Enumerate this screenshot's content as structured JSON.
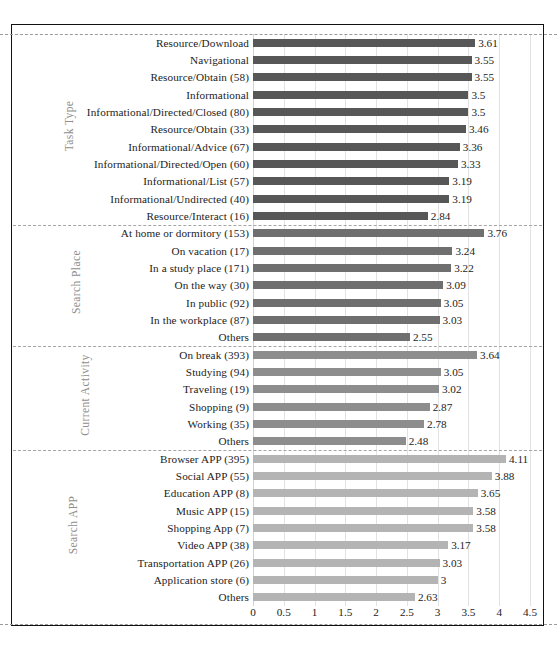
{
  "chart_data": {
    "type": "bar",
    "orientation": "horizontal",
    "title": "",
    "xlabel": "",
    "ylabel": "",
    "xlim": [
      0,
      4.5
    ],
    "xticks": [
      "0",
      "0.5",
      "1",
      "1.5",
      "2",
      "2.5",
      "3",
      "3.5",
      "4",
      "4.5"
    ],
    "xtick_values": [
      0,
      0.5,
      1,
      1.5,
      2,
      2.5,
      3,
      3.5,
      4,
      4.5
    ],
    "grid": true,
    "legend": "none",
    "groups": [
      {
        "name": "Task Type",
        "color": "#575757",
        "categories": [
          "Resource/Download",
          "Navigational",
          "Resource/Obtain (58)",
          "Informational",
          "Informational/Directed/Closed (80)",
          "Resource/Obtain (33)",
          "Informational/Advice (67)",
          "Informational/Directed/Open (60)",
          "Informational/List (57)",
          "Informational/Undirected (40)",
          "Resource/Interact (16)"
        ],
        "values": [
          3.61,
          3.55,
          3.55,
          3.5,
          3.5,
          3.46,
          3.36,
          3.33,
          3.19,
          3.19,
          2.84
        ],
        "value_labels": [
          "3.61",
          "3.55",
          "3.55",
          "3.5",
          "3.5",
          "3.46",
          "3.36",
          "3.33",
          "3.19",
          "3.19",
          "2.84"
        ]
      },
      {
        "name": "Search Place",
        "color": "#6f6f6f",
        "categories": [
          "At home or dormitory (153)",
          "On vacation (17)",
          "In a study place (171)",
          "On the way (30)",
          "In public (92)",
          "In the workplace (87)",
          "Others"
        ],
        "values": [
          3.76,
          3.24,
          3.22,
          3.09,
          3.05,
          3.03,
          2.55
        ],
        "value_labels": [
          "3.76",
          "3.24",
          "3.22",
          "3.09",
          "3.05",
          "3.03",
          "2.55"
        ]
      },
      {
        "name": "Current Activity",
        "color": "#8d8d8d",
        "categories": [
          "On break (393)",
          "Studying (94)",
          "Traveling (19)",
          "Shopping (9)",
          "Working (35)",
          "Others"
        ],
        "values": [
          3.64,
          3.05,
          3.02,
          2.87,
          2.78,
          2.48
        ],
        "value_labels": [
          "3.64",
          "3.05",
          "3.02",
          "2.87",
          "2.78",
          "2.48"
        ]
      },
      {
        "name": "Search APP",
        "color": "#b4b4b4",
        "categories": [
          "Browser APP (395)",
          "Social APP (55)",
          "Education APP (8)",
          "Music APP (15)",
          "Shopping App (7)",
          "Video APP (38)",
          "Transportation APP (26)",
          "Application store (6)",
          "Others"
        ],
        "values": [
          4.11,
          3.88,
          3.65,
          3.58,
          3.58,
          3.17,
          3.03,
          3,
          2.63
        ],
        "value_labels": [
          "4.11",
          "3.88",
          "3.65",
          "3.58",
          "3.58",
          "3.17",
          "3.03",
          "3",
          "2.63"
        ]
      }
    ]
  }
}
